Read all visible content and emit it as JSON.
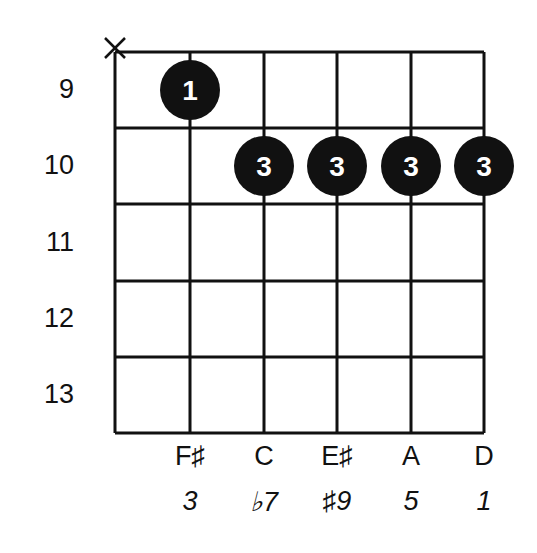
{
  "diagram": {
    "type": "guitar-chord-diagram",
    "colors": {
      "line": "#111111",
      "dot": "#111111",
      "dot_text": "#ffffff",
      "background": "#ffffff"
    },
    "strings_x": [
      115,
      190,
      264,
      337,
      411,
      484
    ],
    "frets_y": [
      52,
      128,
      204,
      281,
      357,
      433
    ],
    "fret_numbers": [
      "9",
      "10",
      "11",
      "12",
      "13"
    ],
    "muted_strings": [
      {
        "string": 1,
        "symbol": "X"
      }
    ],
    "fingers": [
      {
        "string": 2,
        "fret_row": 1,
        "finger": "1"
      },
      {
        "string": 3,
        "fret_row": 2,
        "finger": "3"
      },
      {
        "string": 4,
        "fret_row": 2,
        "finger": "3"
      },
      {
        "string": 5,
        "fret_row": 2,
        "finger": "3"
      },
      {
        "string": 6,
        "fret_row": 2,
        "finger": "3"
      }
    ],
    "notes": [
      {
        "string": 2,
        "label": "F♯"
      },
      {
        "string": 3,
        "label": "C"
      },
      {
        "string": 4,
        "label": "E♯"
      },
      {
        "string": 5,
        "label": "A"
      },
      {
        "string": 6,
        "label": "D"
      }
    ],
    "intervals": [
      {
        "string": 2,
        "label": "3"
      },
      {
        "string": 3,
        "label": "♭7"
      },
      {
        "string": 4,
        "label": "♯9"
      },
      {
        "string": 5,
        "label": "5"
      },
      {
        "string": 6,
        "label": "1"
      }
    ]
  }
}
